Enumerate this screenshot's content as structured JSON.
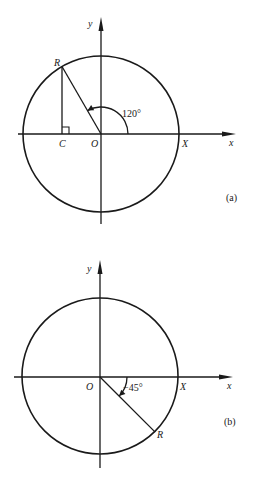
{
  "figures": [
    {
      "id": "a",
      "caption": "(a)",
      "axis_labels": {
        "x": "x",
        "y": "y"
      },
      "points": {
        "origin": "O",
        "radius_point": "R",
        "foot": "C",
        "x_intercept": "X"
      },
      "angle_deg": 120,
      "angle_label": "120°",
      "right_angle_at_foot": true
    },
    {
      "id": "b",
      "caption": "(b)",
      "axis_labels": {
        "x": "x",
        "y": "y"
      },
      "points": {
        "origin": "O",
        "radius_point": "R",
        "x_intercept": "X"
      },
      "angle_deg": -45,
      "angle_label": "−45°",
      "right_angle_at_foot": false
    }
  ],
  "colors": {
    "ink": "#1a1a1a",
    "background": "#ffffff"
  }
}
